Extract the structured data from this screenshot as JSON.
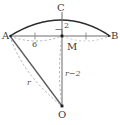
{
  "figure": {
    "points": {
      "A": {
        "label": "A",
        "x": 10,
        "y": 36
      },
      "B": {
        "label": "B",
        "x": 110,
        "y": 36
      },
      "C": {
        "label": "C",
        "x": 62,
        "y": 18
      },
      "M": {
        "label": "M",
        "x": 62,
        "y": 36
      },
      "O": {
        "label": "O",
        "x": 62,
        "y": 106
      }
    },
    "measures": {
      "half_chord": "6",
      "sagitta": "2",
      "radius": "r",
      "apothem": "r−2"
    },
    "colors": {
      "arc": "#2b2b2b",
      "chord": "#6e6e6e",
      "solid_line": "#555555",
      "dashed_line": "#9a9a9a",
      "point_fill": "#1a1a1a",
      "label_text": "#3a3a3a",
      "background": "#ffffff"
    },
    "annotations": {
      "right_angle_at": "M",
      "tick_marks": "equal segments AM and MB"
    }
  }
}
